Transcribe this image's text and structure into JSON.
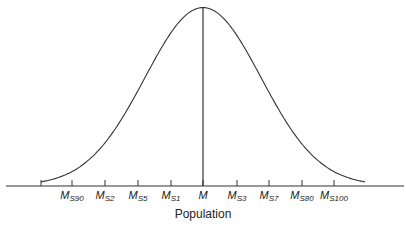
{
  "chart_data": {
    "type": "line",
    "title": "",
    "xlabel": "Population",
    "ylabel": "",
    "grid": false,
    "legend": null,
    "tick_labels": [
      {
        "main": "M",
        "sub": "S90"
      },
      {
        "main": "M",
        "sub": "S2"
      },
      {
        "main": "M",
        "sub": "S5"
      },
      {
        "main": "M",
        "sub": "S1"
      },
      {
        "main": "M",
        "sub": ""
      },
      {
        "main": "M",
        "sub": "S3"
      },
      {
        "main": "M",
        "sub": "S7"
      },
      {
        "main": "M",
        "sub": "S80"
      },
      {
        "main": "M",
        "sub": "S100"
      }
    ],
    "tick_x_px": [
      72,
      105,
      138,
      171,
      203,
      237,
      269,
      302,
      334
    ],
    "extra_left_tick_px": 41,
    "curve": {
      "shape": "normal",
      "center_px": 203,
      "peak_y_px": 8,
      "baseline_y_px": 186,
      "left_end_px": 41,
      "right_end_px": 366
    },
    "annotations": [
      {
        "type": "vertical-line",
        "at": "M"
      }
    ]
  },
  "labels": {
    "xlabel": "Population",
    "ticks": [
      "M_S90",
      "M_S2",
      "M_S5",
      "M_S1",
      "M",
      "M_S3",
      "M_S7",
      "M_S80",
      "M_S100"
    ]
  },
  "colors": {
    "line": "#333333",
    "axis": "#333333",
    "background": "#ffffff"
  }
}
